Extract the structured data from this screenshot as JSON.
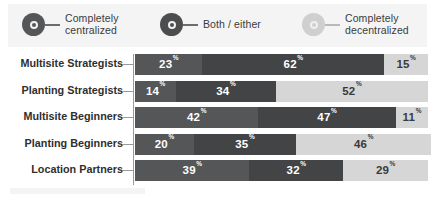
{
  "legend": {
    "items": [
      {
        "label": "Completely\ncentralized",
        "icon": "donut-marker-dark",
        "color": "#555657"
      },
      {
        "label": "Both / either",
        "icon": "donut-marker-medium",
        "color": "#434445"
      },
      {
        "label": "Completely\ndecentralized",
        "icon": "donut-marker-light",
        "color": "#cfcfcf"
      }
    ]
  },
  "chart_data": {
    "type": "bar",
    "orientation": "horizontal",
    "stacked": true,
    "normalized_to_percent": true,
    "title": "",
    "xlabel": "",
    "ylabel": "",
    "xlim": [
      0,
      100
    ],
    "grid": false,
    "legend_position": "top",
    "unit_suffix": "%",
    "categories": [
      "Multisite Strategists",
      "Planting Strategists",
      "Multisite Beginners",
      "Planting Beginners",
      "Location Partners"
    ],
    "series": [
      {
        "name": "Completely centralized",
        "color": "#555657",
        "values": [
          23,
          14,
          42,
          20,
          39
        ]
      },
      {
        "name": "Both / either",
        "color": "#434445",
        "values": [
          62,
          34,
          47,
          35,
          32
        ]
      },
      {
        "name": "Completely decentralized",
        "color": "#d6d6d6",
        "values": [
          15,
          52,
          11,
          46,
          29
        ]
      }
    ],
    "rows": [
      {
        "category": "Multisite Strategists",
        "segments": [
          {
            "value": 23,
            "label": "23",
            "suffix": "%"
          },
          {
            "value": 62,
            "label": "62",
            "suffix": "%"
          },
          {
            "value": 15,
            "label": "15",
            "suffix": "%"
          }
        ]
      },
      {
        "category": "Planting Strategists",
        "segments": [
          {
            "value": 14,
            "label": "14",
            "suffix": "%"
          },
          {
            "value": 34,
            "label": "34",
            "suffix": "%"
          },
          {
            "value": 52,
            "label": "52",
            "suffix": "%"
          }
        ]
      },
      {
        "category": "Multisite Beginners",
        "segments": [
          {
            "value": 42,
            "label": "42",
            "suffix": "%"
          },
          {
            "value": 47,
            "label": "47",
            "suffix": "%"
          },
          {
            "value": 11,
            "label": "11",
            "suffix": "%"
          }
        ]
      },
      {
        "category": "Planting Beginners",
        "segments": [
          {
            "value": 20,
            "label": "20",
            "suffix": "%"
          },
          {
            "value": 35,
            "label": "35",
            "suffix": "%"
          },
          {
            "value": 46,
            "label": "46",
            "suffix": "%"
          }
        ]
      },
      {
        "category": "Location Partners",
        "segments": [
          {
            "value": 39,
            "label": "39",
            "suffix": "%"
          },
          {
            "value": 32,
            "label": "32",
            "suffix": "%"
          },
          {
            "value": 29,
            "label": "29",
            "suffix": "%"
          }
        ]
      }
    ]
  }
}
